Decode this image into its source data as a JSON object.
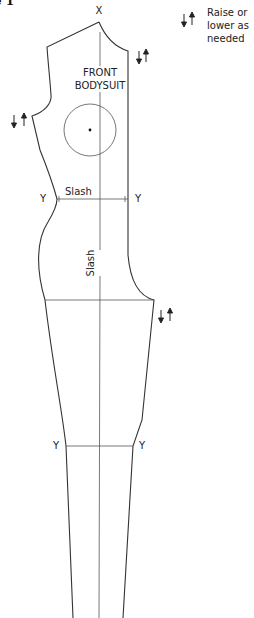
{
  "figure": {
    "title_fragment": "e 1"
  },
  "legend": {
    "icon": "raise-lower-arrows-icon",
    "lines": [
      "Raise or",
      "lower as",
      "needed"
    ]
  },
  "pattern": {
    "name_line1": "FRONT",
    "name_line2": "BODYSUIT",
    "top_mark": "X",
    "waist_left_mark": "Y",
    "waist_right_mark": "Y",
    "waist_slash_label": "Slash",
    "vertical_slash_label": "Slash",
    "knee_left_mark": "Y",
    "knee_right_mark": "Y"
  },
  "colors": {
    "line": "#333333",
    "guide": "#666666",
    "background": "#ffffff"
  }
}
